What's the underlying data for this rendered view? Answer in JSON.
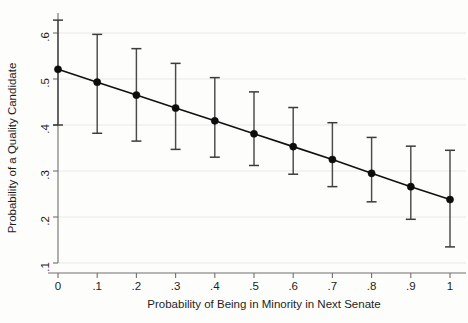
{
  "chart_data": {
    "type": "line",
    "title": "",
    "xlabel": "Probability of Being in Minority in Next Senate",
    "ylabel": "Probability of a Quality Candidate",
    "x": [
      0,
      0.1,
      0.2,
      0.3,
      0.4,
      0.5,
      0.6,
      0.7,
      0.8,
      0.9,
      1
    ],
    "values": [
      0.521,
      0.493,
      0.465,
      0.437,
      0.409,
      0.381,
      0.353,
      0.325,
      0.295,
      0.266,
      0.238
    ],
    "ci_lower": [
      0.4,
      0.382,
      0.365,
      0.347,
      0.33,
      0.312,
      0.293,
      0.266,
      0.233,
      0.195,
      0.135
    ],
    "ci_upper": [
      0.628,
      0.597,
      0.566,
      0.534,
      0.503,
      0.472,
      0.438,
      0.405,
      0.373,
      0.354,
      0.345
    ],
    "xlim": [
      0,
      1
    ],
    "ylim": [
      0.1,
      0.6
    ],
    "xticks": [
      0,
      0.1,
      0.2,
      0.3,
      0.4,
      0.5,
      0.6,
      0.7,
      0.8,
      0.9,
      1
    ],
    "xticklabels": [
      "0",
      ".1",
      ".2",
      ".3",
      ".4",
      ".5",
      ".6",
      ".7",
      ".8",
      ".9",
      "1"
    ],
    "yticks": [
      0.1,
      0.2,
      0.3,
      0.4,
      0.5,
      0.6
    ],
    "yticklabels": [
      ".1",
      ".2",
      ".3",
      ".4",
      ".5",
      ".6"
    ],
    "grid": true,
    "grid_axis": "y",
    "legend": "none",
    "marker": "circle",
    "error_bars": "capped-vertical",
    "series_name": "Predicted probability",
    "colors": {
      "line": "#111111",
      "marker": "#0d0d0d",
      "error_bar": "#4a4a4a",
      "gridline": "#e9e9e7",
      "axis": "#6f6f6f",
      "background": "#fdfdfb",
      "text": "#1d1d1d"
    }
  }
}
